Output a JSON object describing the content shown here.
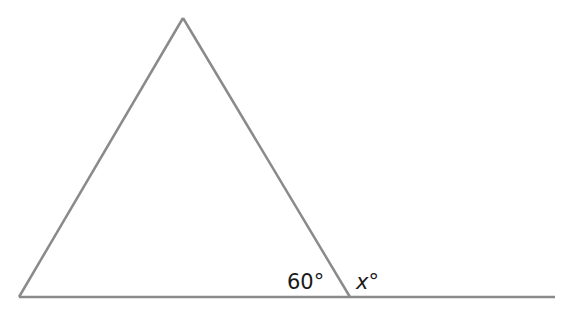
{
  "diagram": {
    "type": "geometry-triangle-exterior-angle",
    "stroke_color": "#8a8a8a",
    "text_color": "#1a1a1a",
    "points": {
      "apex": [
        183,
        18
      ],
      "left_base": [
        19,
        297
      ],
      "right_base": [
        350,
        297
      ],
      "line_end": [
        555,
        297
      ]
    },
    "labels": {
      "interior_angle": "60°",
      "exterior_var": "x",
      "exterior_deg": "°"
    }
  }
}
